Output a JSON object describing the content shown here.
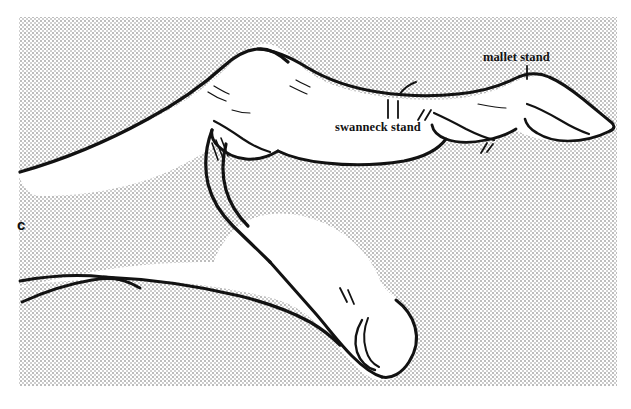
{
  "figure": {
    "panel_letter": "c",
    "background_color": "#ffffff",
    "halftone_color": "#d9d9d9",
    "ink_color": "#121212",
    "halftone_region": {
      "left": 19,
      "top": 17,
      "right": 617,
      "bottom": 386
    },
    "annotations": [
      {
        "id": "mallet",
        "label": "mallet stand",
        "x": 483,
        "y": 51,
        "leader_from": [
          527,
          66
        ],
        "leader_to": [
          527,
          78
        ]
      },
      {
        "id": "swanneck",
        "label": "swanneck stand",
        "x": 335,
        "y": 121,
        "leader_from": [
          392,
          118
        ],
        "leader_to": [
          392,
          98
        ]
      }
    ]
  }
}
